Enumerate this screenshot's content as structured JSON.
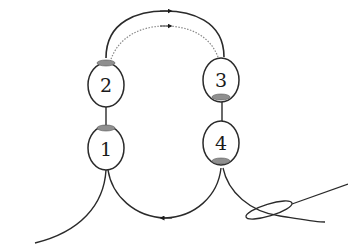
{
  "diagram": {
    "type": "cyclic node diagram",
    "nodes": [
      {
        "id": "1",
        "label": "1",
        "cx": 106,
        "cy": 148,
        "cap": "top"
      },
      {
        "id": "2",
        "label": "2",
        "cx": 106,
        "cy": 85,
        "cap": "top"
      },
      {
        "id": "3",
        "label": "3",
        "cx": 221,
        "cy": 80,
        "cap": "bottom"
      },
      {
        "id": "4",
        "label": "4",
        "cx": 221,
        "cy": 143,
        "cap": "bottom"
      }
    ],
    "edges": [
      {
        "from": "2",
        "to": "3",
        "style": "solid",
        "arrow": "right"
      },
      {
        "from": "2",
        "to": "3",
        "style": "dotted",
        "arrow": "right"
      },
      {
        "from": "4",
        "to": "1",
        "style": "solid",
        "arrow": "left"
      },
      {
        "from": "1",
        "to": "2",
        "style": "solid-link"
      },
      {
        "from": "3",
        "to": "4",
        "style": "solid-link"
      }
    ],
    "colors": {
      "stroke": "#2a2a2a",
      "dotted": "#8a8a8a",
      "cap": "#8f8f8f",
      "node_fill": "#ffffff"
    }
  }
}
